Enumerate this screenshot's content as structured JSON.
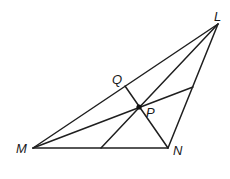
{
  "diagram": {
    "type": "triangle-with-cevians",
    "vertices": {
      "L": {
        "label": "L",
        "x": 218,
        "y": 24
      },
      "M": {
        "label": "M",
        "x": 33,
        "y": 148
      },
      "N": {
        "label": "N",
        "x": 168,
        "y": 148
      }
    },
    "points": {
      "Q": {
        "label": "Q",
        "x": 125,
        "y": 86,
        "on": "ML"
      },
      "P": {
        "label": "P",
        "x": 139,
        "y": 107,
        "type": "intersection"
      },
      "R": {
        "x": 193,
        "y": 87,
        "on": "LN"
      },
      "S": {
        "x": 101,
        "y": 148,
        "on": "MN"
      }
    },
    "segments": [
      {
        "name": "ML",
        "from": "M",
        "to": "L"
      },
      {
        "name": "MN",
        "from": "M",
        "to": "N"
      },
      {
        "name": "NL",
        "from": "N",
        "to": "L"
      },
      {
        "name": "QN",
        "from": "Q",
        "to": "N"
      },
      {
        "name": "MR",
        "from": "M",
        "to": "R"
      },
      {
        "name": "LS",
        "from": "L",
        "to": "S"
      }
    ],
    "labels": {
      "L": "L",
      "M": "M",
      "N": "N",
      "Q": "Q",
      "P": "P"
    },
    "colors": {
      "line": "#1f1f1f",
      "background": "#ffffff"
    }
  }
}
